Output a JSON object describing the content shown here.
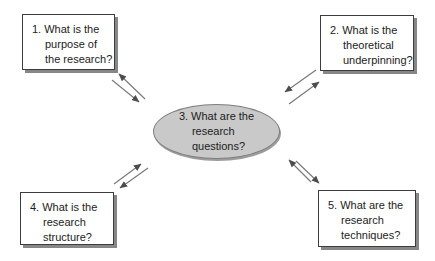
{
  "diagram": {
    "nodes": {
      "top_left": {
        "lines": [
          "1. What is the",
          "purpose of",
          "the research?"
        ]
      },
      "top_right": {
        "lines": [
          "2. What is the",
          "theoretical",
          "underpinning?"
        ]
      },
      "center": {
        "lines": [
          "3. What are the",
          "research",
          "questions?"
        ]
      },
      "bottom_left": {
        "lines": [
          "4. What is the",
          "research",
          "structure?"
        ]
      },
      "bottom_right": {
        "lines": [
          "5. What are the",
          "research",
          "techniques?"
        ]
      }
    },
    "connections": [
      {
        "from": "center",
        "to": "top_left",
        "bidirectional": true
      },
      {
        "from": "center",
        "to": "top_right",
        "bidirectional": true
      },
      {
        "from": "center",
        "to": "bottom_left",
        "bidirectional": true
      },
      {
        "from": "center",
        "to": "bottom_right",
        "bidirectional": true
      }
    ],
    "colors": {
      "background": "#ffffff",
      "box_fill": "#ffffff",
      "box_border": "#3d3d3d",
      "shadow": "#878787",
      "ellipse_fill": "#c9c9c9",
      "ellipse_border": "#7e7e7e",
      "arrow": "#777777",
      "arrowhead": "#4d4d4d",
      "text": "#1c1c1c"
    }
  }
}
